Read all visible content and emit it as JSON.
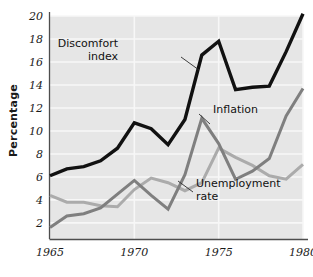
{
  "chart_data": {
    "type": "line",
    "title": "",
    "subtitle": "",
    "xlabel": "",
    "ylabel": "Percentage",
    "xlim": [
      1965,
      1980
    ],
    "ylim": [
      0.6,
      20
    ],
    "grid": true,
    "legend_position": "inline-annotations",
    "x": [
      1965,
      1966,
      1967,
      1968,
      1969,
      1970,
      1971,
      1972,
      1973,
      1974,
      1975,
      1976,
      1977,
      1978,
      1979,
      1980
    ],
    "xticks": [
      "1965",
      "1970",
      "1975",
      "1980"
    ],
    "xtick_values": [
      1965,
      1970,
      1975,
      1980
    ],
    "yticks": [
      "2",
      "4",
      "6",
      "8",
      "10",
      "12",
      "14",
      "16",
      "18",
      "20"
    ],
    "ytick_values": [
      2,
      4,
      6,
      8,
      10,
      12,
      14,
      16,
      18,
      20
    ],
    "series": [
      {
        "name": "Discomfort index",
        "color": "#111111",
        "width": 3.4,
        "values": [
          6.1,
          6.7,
          6.9,
          7.4,
          8.5,
          10.7,
          10.2,
          8.8,
          11.0,
          16.6,
          17.8,
          13.6,
          13.8,
          13.9,
          16.9,
          20.2
        ]
      },
      {
        "name": "Inflation",
        "color": "#7f7f7f",
        "width": 3.0,
        "values": [
          1.6,
          2.6,
          2.8,
          3.3,
          4.5,
          5.7,
          4.4,
          3.2,
          6.2,
          11.1,
          8.9,
          5.8,
          6.5,
          7.6,
          11.3,
          13.7
        ]
      },
      {
        "name": "Unemployment rate",
        "color": "#ababab",
        "width": 3.0,
        "values": [
          4.4,
          3.8,
          3.8,
          3.5,
          3.4,
          4.9,
          5.9,
          5.5,
          4.8,
          5.5,
          8.5,
          7.7,
          7.0,
          6.1,
          5.8,
          7.1
        ]
      }
    ],
    "annotations": [
      {
        "id": "discomfort-index-label",
        "text_lines": [
          "Discomfort",
          "index"
        ],
        "text": "Discomfort index",
        "color": "#111111",
        "x": 118,
        "y": 47,
        "align": "right",
        "leader": {
          "x1": 181,
          "y1": 57,
          "x2": 199,
          "y2": 70
        }
      },
      {
        "id": "inflation-label",
        "text_lines": [
          "Inflation"
        ],
        "text": "Inflation",
        "color": "#111111",
        "x": 213,
        "y": 113,
        "align": "left",
        "leader": {
          "x1": 210,
          "y1": 124,
          "x2": 199,
          "y2": 114
        }
      },
      {
        "id": "unemployment-rate-label",
        "text_lines": [
          "Unemployment",
          "rate"
        ],
        "text": "Unemployment rate",
        "color": "#111111",
        "x": 196,
        "y": 187,
        "align": "left",
        "leader": {
          "x1": 193,
          "y1": 192,
          "x2": 178,
          "y2": 181
        }
      }
    ],
    "colors": {
      "plot_background": "#e6e6e6",
      "gridline": "#f7f7f7",
      "axis": "#4d4d4d",
      "tick_label": "#1a1a1a",
      "discomfort_index": "#111111",
      "inflation": "#7f7f7f",
      "unemployment_rate": "#ababab"
    }
  }
}
